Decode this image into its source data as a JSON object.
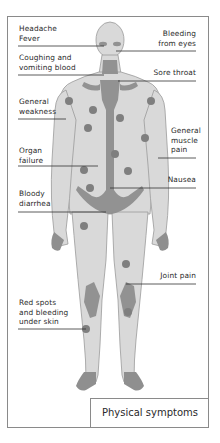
{
  "diagram": {
    "title": "Physical symptoms",
    "colors": {
      "body_fill": "#d9d9d9",
      "body_outline": "#9a9a9a",
      "highlight": "#8f8f8f",
      "spot": "#7f7f7f",
      "leader_line": "#333333",
      "frame": "#8a8a8a"
    },
    "labels_left": [
      {
        "id": "headache",
        "text": "Headache\nFever"
      },
      {
        "id": "coughing",
        "text": "Coughing and\nvomiting blood"
      },
      {
        "id": "weakness",
        "text": "General\nweakness"
      },
      {
        "id": "organ",
        "text": "Organ\nfailure"
      },
      {
        "id": "diarrhea",
        "text": "Bloody\ndiarrhea"
      },
      {
        "id": "redspots",
        "text": "Red spots\nand bleeding\nunder skin"
      }
    ],
    "labels_right": [
      {
        "id": "eyes",
        "text": "Bleeding\nfrom eyes"
      },
      {
        "id": "throat",
        "text": "Sore throat"
      },
      {
        "id": "muscle",
        "text": "General\nmuscle\npain"
      },
      {
        "id": "nausea",
        "text": "Nausea"
      },
      {
        "id": "joint",
        "text": "Joint pain"
      }
    ]
  }
}
